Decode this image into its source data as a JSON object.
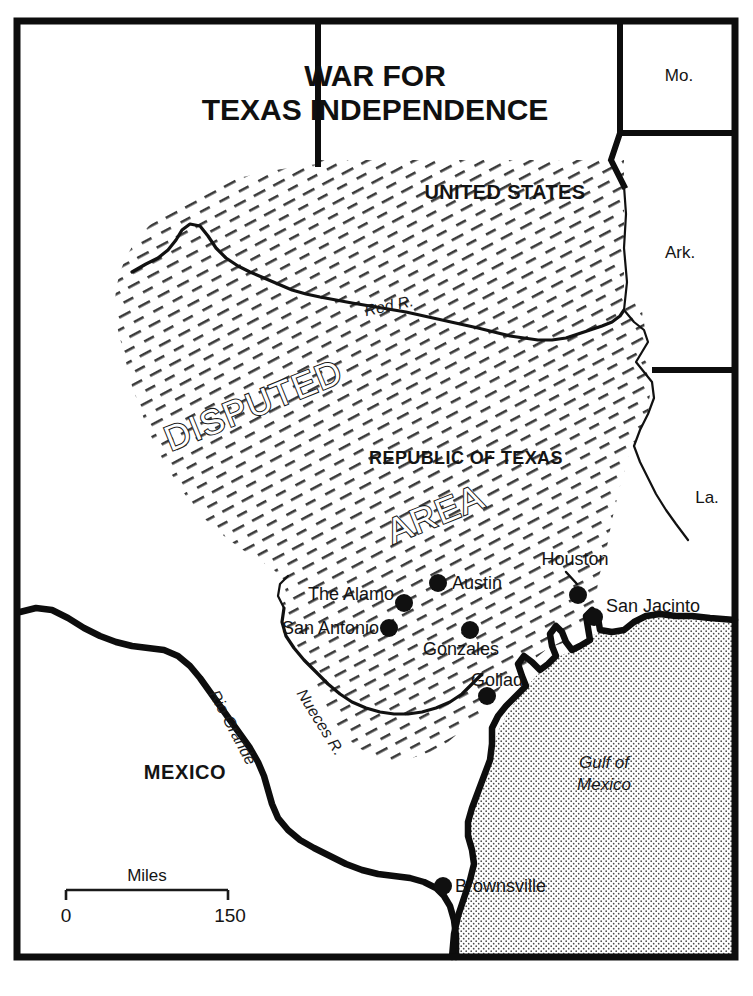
{
  "map": {
    "title_line1": "WAR FOR",
    "title_line2": "TEXAS INDEPENDENCE",
    "regions": {
      "united_states": "UNITED STATES",
      "republic_of_texas": "REPUBLIC OF TEXAS",
      "disputed_word1": "DISPUTED",
      "disputed_word2": "AREA",
      "mexico": "MEXICO",
      "gulf_line1": "Gulf of",
      "gulf_line2": "Mexico"
    },
    "states": [
      {
        "label": "Mo."
      },
      {
        "label": "Ark."
      },
      {
        "label": "La."
      }
    ],
    "rivers": [
      {
        "label": "Red R."
      },
      {
        "label": "Rio Grande"
      },
      {
        "label": "Nueces R."
      }
    ],
    "cities": [
      {
        "label": "Austin"
      },
      {
        "label": "The Alamo"
      },
      {
        "label": "San Antonio"
      },
      {
        "label": "Gonzales"
      },
      {
        "label": "Goliad"
      },
      {
        "label": "Houston"
      },
      {
        "label": "San Jacinto"
      },
      {
        "label": "Brownsville"
      }
    ],
    "scale": {
      "caption": "Miles",
      "min": "0",
      "max": "150"
    },
    "colors": {
      "ink": "#0d0d0d",
      "paper": "#ffffff",
      "hatch": "#3a3a3a",
      "water_stipple": "#4a4a4a"
    }
  }
}
